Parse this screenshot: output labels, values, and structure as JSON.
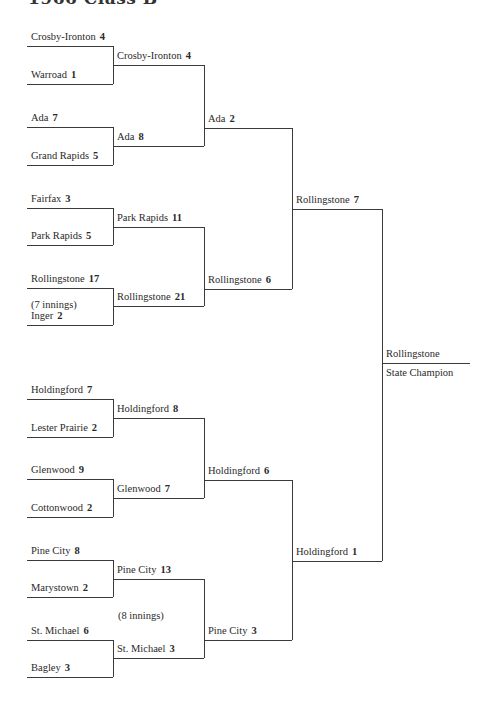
{
  "title": "1966 Class B",
  "slots": [
    {
      "id": "r1-1",
      "team": "Crosby-Ironton",
      "score": "4",
      "x1": 27,
      "x2": 113,
      "y": 46
    },
    {
      "id": "r1-2",
      "team": "Warroad",
      "score": "1",
      "x1": 27,
      "x2": 113,
      "y": 84
    },
    {
      "id": "r1-3",
      "team": "Ada",
      "score": "7",
      "x1": 27,
      "x2": 113,
      "y": 127
    },
    {
      "id": "r1-4",
      "team": "Grand Rapids",
      "score": "5",
      "x1": 27,
      "x2": 113,
      "y": 165
    },
    {
      "id": "r1-5",
      "team": "Fairfax",
      "score": "3",
      "x1": 27,
      "x2": 113,
      "y": 208
    },
    {
      "id": "r1-6",
      "team": "Park Rapids",
      "score": "5",
      "x1": 27,
      "x2": 113,
      "y": 245
    },
    {
      "id": "r1-7",
      "team": "Rollingstone",
      "score": "17",
      "x1": 27,
      "x2": 113,
      "y": 288
    },
    {
      "id": "r1-8",
      "team": "Inger",
      "score": "2",
      "x1": 27,
      "x2": 113,
      "y": 325
    },
    {
      "id": "r1-9",
      "team": "Holdingford",
      "score": "7",
      "x1": 27,
      "x2": 113,
      "y": 399
    },
    {
      "id": "r1-10",
      "team": "Lester Prairie",
      "score": "2",
      "x1": 27,
      "x2": 113,
      "y": 437
    },
    {
      "id": "r1-11",
      "team": "Glenwood",
      "score": "9",
      "x1": 27,
      "x2": 113,
      "y": 479
    },
    {
      "id": "r1-12",
      "team": "Cottonwood",
      "score": "2",
      "x1": 27,
      "x2": 113,
      "y": 517
    },
    {
      "id": "r1-13",
      "team": "Pine City",
      "score": "8",
      "x1": 27,
      "x2": 113,
      "y": 560
    },
    {
      "id": "r1-14",
      "team": "Marystown",
      "score": "2",
      "x1": 27,
      "x2": 113,
      "y": 597
    },
    {
      "id": "r1-15",
      "team": "St. Michael",
      "score": "6",
      "x1": 27,
      "x2": 113,
      "y": 640
    },
    {
      "id": "r1-16",
      "team": "Bagley",
      "score": "3",
      "x1": 27,
      "x2": 113,
      "y": 677
    },
    {
      "id": "r2-1",
      "team": "Crosby-Ironton",
      "score": "4",
      "x1": 113,
      "x2": 204,
      "y": 65
    },
    {
      "id": "r2-2",
      "team": "Ada",
      "score": "8",
      "x1": 113,
      "x2": 204,
      "y": 146
    },
    {
      "id": "r2-3",
      "team": "Park Rapids",
      "score": "11",
      "x1": 113,
      "x2": 204,
      "y": 227
    },
    {
      "id": "r2-4",
      "team": "Rollingstone",
      "score": "21",
      "x1": 113,
      "x2": 204,
      "y": 306
    },
    {
      "id": "r2-5",
      "team": "Holdingford",
      "score": "8",
      "x1": 113,
      "x2": 204,
      "y": 418
    },
    {
      "id": "r2-6",
      "team": "Glenwood",
      "score": "7",
      "x1": 113,
      "x2": 204,
      "y": 498
    },
    {
      "id": "r2-7",
      "team": "Pine City",
      "score": "13",
      "x1": 113,
      "x2": 204,
      "y": 579
    },
    {
      "id": "r2-8",
      "team": "St. Michael",
      "score": "3",
      "x1": 113,
      "x2": 204,
      "y": 658
    },
    {
      "id": "r3-1",
      "team": "Ada",
      "score": "2",
      "x1": 204,
      "x2": 292,
      "y": 128
    },
    {
      "id": "r3-2",
      "team": "Rollingstone",
      "score": "6",
      "x1": 204,
      "x2": 292,
      "y": 289
    },
    {
      "id": "r3-3",
      "team": "Holdingford",
      "score": "6",
      "x1": 204,
      "x2": 292,
      "y": 480
    },
    {
      "id": "r3-4",
      "team": "Pine City",
      "score": "3",
      "x1": 204,
      "x2": 292,
      "y": 640
    },
    {
      "id": "r4-1",
      "team": "Rollingstone",
      "score": "7",
      "x1": 292,
      "x2": 382,
      "y": 209
    },
    {
      "id": "r4-2",
      "team": "Holdingford",
      "score": "1",
      "x1": 292,
      "x2": 382,
      "y": 561
    },
    {
      "id": "champion",
      "team": "Rollingstone",
      "score": "",
      "x1": 382,
      "x2": 470,
      "y": 363
    }
  ],
  "verticals": [
    {
      "x": 113,
      "y1": 46,
      "y2": 84
    },
    {
      "x": 113,
      "y1": 127,
      "y2": 165
    },
    {
      "x": 113,
      "y1": 208,
      "y2": 245
    },
    {
      "x": 113,
      "y1": 288,
      "y2": 325
    },
    {
      "x": 113,
      "y1": 399,
      "y2": 437
    },
    {
      "x": 113,
      "y1": 479,
      "y2": 517
    },
    {
      "x": 113,
      "y1": 560,
      "y2": 597
    },
    {
      "x": 113,
      "y1": 640,
      "y2": 677
    },
    {
      "x": 204,
      "y1": 65,
      "y2": 146
    },
    {
      "x": 204,
      "y1": 227,
      "y2": 306
    },
    {
      "x": 204,
      "y1": 418,
      "y2": 498
    },
    {
      "x": 204,
      "y1": 579,
      "y2": 658
    },
    {
      "x": 292,
      "y1": 128,
      "y2": 289
    },
    {
      "x": 292,
      "y1": 480,
      "y2": 640
    },
    {
      "x": 382,
      "y1": 209,
      "y2": 561
    }
  ],
  "notes": [
    {
      "id": "note-7-innings",
      "text": "(7 innings)",
      "x": 31,
      "y": 299
    },
    {
      "id": "note-8-innings",
      "text": "(8 innings)",
      "x": 118,
      "y": 610
    },
    {
      "id": "state-champion",
      "text": "State Champion",
      "x": 386,
      "y": 367
    }
  ]
}
